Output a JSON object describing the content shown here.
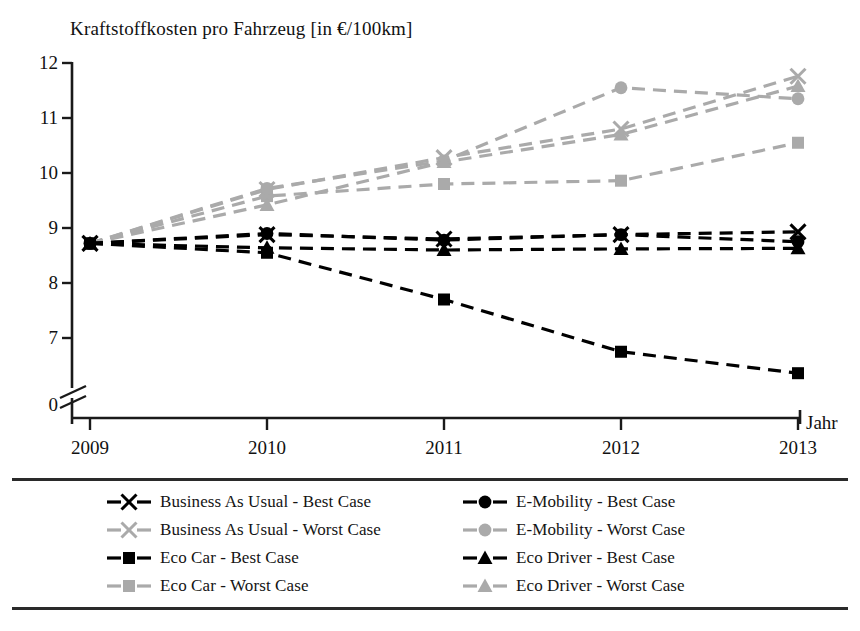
{
  "chart_data": {
    "type": "line",
    "title": "Kraftstoffkosten pro Fahrzeug [in €/100km]",
    "xlabel": "Jahr",
    "ylabel": "",
    "categories": [
      "2009",
      "2010",
      "2011",
      "2012",
      "2013"
    ],
    "x": [
      2009,
      2010,
      2011,
      2012,
      2013
    ],
    "ylim": [
      6.2,
      12
    ],
    "yticks": [
      7,
      8,
      9,
      10,
      11,
      12
    ],
    "ytick_labels": [
      "0",
      "7",
      "8",
      "9",
      "10",
      "11",
      "12"
    ],
    "axis_break": true,
    "axis_break_label": "0",
    "grid": false,
    "legend_position": "bottom",
    "legend_columns": 2,
    "series": [
      {
        "name": "Business As Usual - Best Case",
        "marker": "x",
        "color": "#000000",
        "dash": "dashed",
        "values": [
          8.72,
          8.88,
          8.8,
          8.88,
          8.93
        ]
      },
      {
        "name": "Business As Usual - Worst Case",
        "marker": "x",
        "color": "#aaaaaa",
        "dash": "dashed",
        "values": [
          8.72,
          9.7,
          10.28,
          10.8,
          11.76
        ]
      },
      {
        "name": "Eco Car - Best Case",
        "marker": "square",
        "color": "#000000",
        "dash": "dashed",
        "values": [
          8.72,
          8.55,
          7.7,
          6.75,
          6.36
        ]
      },
      {
        "name": "Eco Car - Worst Case",
        "marker": "square",
        "color": "#aaaaaa",
        "dash": "dashed",
        "values": [
          8.72,
          9.58,
          9.8,
          9.86,
          10.55
        ]
      },
      {
        "name": "E-Mobility - Best Case",
        "marker": "circle",
        "color": "#000000",
        "dash": "dashed",
        "values": [
          8.72,
          8.9,
          8.78,
          8.88,
          8.75
        ]
      },
      {
        "name": "E-Mobility - Worst Case",
        "marker": "circle",
        "color": "#aaaaaa",
        "dash": "dashed",
        "values": [
          8.72,
          9.72,
          10.22,
          11.55,
          11.35
        ]
      },
      {
        "name": "Eco Driver - Best Case",
        "marker": "triangle",
        "color": "#000000",
        "dash": "dashed",
        "values": [
          8.72,
          8.64,
          8.6,
          8.62,
          8.63
        ]
      },
      {
        "name": "Eco Driver - Worst Case",
        "marker": "triangle",
        "color": "#aaaaaa",
        "dash": "dashed",
        "values": [
          8.72,
          9.42,
          10.2,
          10.7,
          11.58
        ]
      }
    ]
  },
  "title": {
    "text": "Kraftstoffkosten pro Fahrzeug [in €/100km]"
  },
  "axes": {
    "x_title": "Jahr",
    "y_ticks": [
      "12",
      "11",
      "10",
      "9",
      "8",
      "7",
      "0"
    ],
    "x_ticks": [
      "2009",
      "2010",
      "2011",
      "2012",
      "2013"
    ]
  },
  "legend": {
    "left_column": [
      {
        "label": "Business As Usual - Best Case",
        "marker": "x-marker",
        "color": "#000000"
      },
      {
        "label": "Business As Usual - Worst Case",
        "marker": "x-marker",
        "color": "#aaaaaa"
      },
      {
        "label": "Eco Car - Best Case",
        "marker": "square-marker",
        "color": "#000000"
      },
      {
        "label": "Eco Car - Worst Case",
        "marker": "square-marker",
        "color": "#aaaaaa"
      }
    ],
    "right_column": [
      {
        "label": "E-Mobility - Best Case",
        "marker": "circle-marker",
        "color": "#000000"
      },
      {
        "label": "E-Mobility - Worst Case",
        "marker": "circle-marker",
        "color": "#aaaaaa"
      },
      {
        "label": "Eco Driver - Best Case",
        "marker": "triangle-marker",
        "color": "#000000"
      },
      {
        "label": "Eco Driver - Worst Case",
        "marker": "triangle-marker",
        "color": "#aaaaaa"
      }
    ]
  },
  "colors": {
    "best_case": "#000000",
    "worst_case": "#aaaaaa",
    "axis": "#1a1a1a",
    "background": "#ffffff"
  }
}
